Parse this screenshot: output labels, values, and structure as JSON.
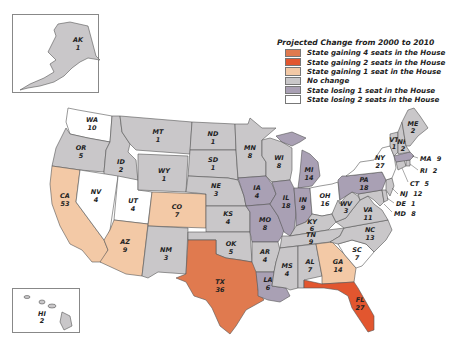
{
  "legend": {
    "title": "Projected Change from 2000 to 2010",
    "items": [
      {
        "label": "State gaining 4 seats in the House",
        "color": "#e07a4f"
      },
      {
        "label": "State gaining 2 seats in the House",
        "color": "#e2562f"
      },
      {
        "label": "State gaining 1 seat in the House",
        "color": "#f3c9a6"
      },
      {
        "label": "No change",
        "color": "#c9c7c9"
      },
      {
        "label": "State losing 1 seat in the House",
        "color": "#a9a0b4"
      },
      {
        "label": "State losing 2 seats in the House",
        "color": "#ffffff"
      }
    ]
  },
  "colors": {
    "gain4": "#e07a4f",
    "gain2": "#e2562f",
    "gain1": "#f3c9a6",
    "none": "#c9c7c9",
    "lose1": "#a9a0b4",
    "lose2": "#ffffff",
    "stroke": "#555555"
  },
  "states": {
    "AK": {
      "abbr": "AK",
      "seats": "1"
    },
    "HI": {
      "abbr": "HI",
      "seats": "2"
    },
    "WA": {
      "abbr": "WA",
      "seats": "10"
    },
    "OR": {
      "abbr": "OR",
      "seats": "5"
    },
    "CA": {
      "abbr": "CA",
      "seats": "53"
    },
    "ID": {
      "abbr": "ID",
      "seats": "2"
    },
    "NV": {
      "abbr": "NV",
      "seats": "4"
    },
    "UT": {
      "abbr": "UT",
      "seats": "4"
    },
    "AZ": {
      "abbr": "AZ",
      "seats": "9"
    },
    "MT": {
      "abbr": "MT",
      "seats": "1"
    },
    "WY": {
      "abbr": "WY",
      "seats": "1"
    },
    "CO": {
      "abbr": "CO",
      "seats": "7"
    },
    "NM": {
      "abbr": "NM",
      "seats": "3"
    },
    "ND": {
      "abbr": "ND",
      "seats": "1"
    },
    "SD": {
      "abbr": "SD",
      "seats": "1"
    },
    "NE": {
      "abbr": "NE",
      "seats": "3"
    },
    "KS": {
      "abbr": "KS",
      "seats": "4"
    },
    "OK": {
      "abbr": "OK",
      "seats": "5"
    },
    "TX": {
      "abbr": "TX",
      "seats": "36"
    },
    "MN": {
      "abbr": "MN",
      "seats": "8"
    },
    "IA": {
      "abbr": "IA",
      "seats": "4"
    },
    "MO": {
      "abbr": "MO",
      "seats": "8"
    },
    "AR": {
      "abbr": "AR",
      "seats": "4"
    },
    "LA": {
      "abbr": "LA",
      "seats": "6"
    },
    "WI": {
      "abbr": "WI",
      "seats": "8"
    },
    "IL": {
      "abbr": "IL",
      "seats": "18"
    },
    "MI": {
      "abbr": "MI",
      "seats": "14"
    },
    "IN": {
      "abbr": "IN",
      "seats": "9"
    },
    "OH": {
      "abbr": "OH",
      "seats": "16"
    },
    "KY": {
      "abbr": "KY",
      "seats": "6"
    },
    "TN": {
      "abbr": "TN",
      "seats": "9"
    },
    "MS": {
      "abbr": "MS",
      "seats": "4"
    },
    "AL": {
      "abbr": "AL",
      "seats": "7"
    },
    "GA": {
      "abbr": "GA",
      "seats": "14"
    },
    "FL": {
      "abbr": "FL",
      "seats": "27"
    },
    "SC": {
      "abbr": "SC",
      "seats": "7"
    },
    "NC": {
      "abbr": "NC",
      "seats": "13"
    },
    "VA": {
      "abbr": "VA",
      "seats": "11"
    },
    "WV": {
      "abbr": "WV",
      "seats": "3"
    },
    "PA": {
      "abbr": "PA",
      "seats": "18"
    },
    "NY": {
      "abbr": "NY",
      "seats": "27"
    },
    "VT": {
      "abbr": "VT",
      "seats": "1"
    },
    "NH": {
      "abbr": "NH",
      "seats": "2"
    },
    "ME": {
      "abbr": "ME",
      "seats": "2"
    },
    "MA": {
      "abbr": "MA",
      "seats": "9"
    },
    "RI": {
      "abbr": "RI",
      "seats": "2"
    },
    "CT": {
      "abbr": "CT",
      "seats": "5"
    },
    "NJ": {
      "abbr": "NJ",
      "seats": "12"
    },
    "DE": {
      "abbr": "DE",
      "seats": "1"
    },
    "MD": {
      "abbr": "MD",
      "seats": "8"
    }
  }
}
